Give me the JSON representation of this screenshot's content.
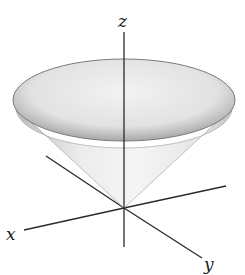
{
  "diagram": {
    "title": "",
    "shape": "cone",
    "axes": {
      "x_label": "x",
      "y_label": "y",
      "z_label": "z"
    },
    "colors": {
      "axis": "#2a2a2a",
      "surface_light": "#f4f4f4",
      "surface_dark": "#b8b8b8",
      "rim": "#8a8a8a"
    }
  }
}
